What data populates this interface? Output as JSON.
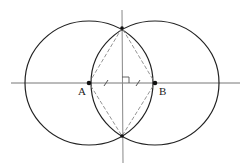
{
  "diagram": {
    "points": [
      {
        "id": "A",
        "label": "A",
        "x": 89,
        "y": 83
      },
      {
        "id": "B",
        "label": "B",
        "x": 155,
        "y": 83
      },
      {
        "id": "P",
        "label": "",
        "x": 122,
        "y": 28
      },
      {
        "id": "Q",
        "label": "",
        "x": 122,
        "y": 136
      }
    ],
    "circles": [
      {
        "center": "A",
        "rx": 64,
        "ry": 62
      },
      {
        "center": "B",
        "rx": 64,
        "ry": 62
      }
    ],
    "lines": [
      {
        "name": "line-AB",
        "style": "solid"
      },
      {
        "name": "perpendicular-bisector",
        "style": "solid"
      }
    ],
    "dashed_rhombus": [
      "A",
      "P",
      "B",
      "Q"
    ],
    "markers": {
      "right_angle": true,
      "equal_segments_ticks": 2
    },
    "colors": {
      "stroke": "#222222",
      "axis": "#777777",
      "dashed": "#888888"
    }
  }
}
